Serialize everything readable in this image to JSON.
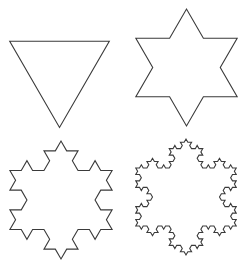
{
  "diagram": {
    "stroke_color": "#3a3a3a",
    "background": "#ffffff",
    "panels": [
      {
        "name": "iteration-0",
        "iterations": 0,
        "cx": 59.5,
        "cy": 70,
        "radius": 57.5,
        "orientation": "point-down"
      },
      {
        "name": "iteration-1",
        "iterations": 1,
        "cx": 186.5,
        "cy": 67.5,
        "radius": 58.5,
        "orientation": "point-down"
      },
      {
        "name": "iteration-2",
        "iterations": 2,
        "cx": 61,
        "cy": 200,
        "radius": 59,
        "orientation": "point-down"
      },
      {
        "name": "iteration-3",
        "iterations": 3,
        "cx": 186,
        "cy": 197,
        "radius": 58,
        "orientation": "point-down"
      }
    ]
  }
}
